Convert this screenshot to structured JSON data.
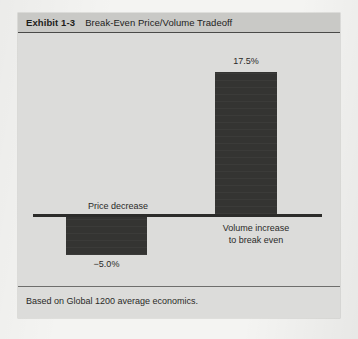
{
  "exhibit": {
    "number": "Exhibit 1-3",
    "title": "Break-Even Price/Volume Tradeoff",
    "footnote": "Based on Global 1200 average economics."
  },
  "chart_data": {
    "type": "bar",
    "title": "Break-Even Price/Volume Tradeoff",
    "subtitle": "",
    "xlabel": "",
    "ylabel": "",
    "categories": [
      "Price decrease",
      "Volume increase to break even"
    ],
    "category_labels": [
      {
        "line1": "Price decrease",
        "line2": ""
      },
      {
        "line1": "Volume increase",
        "line2": "to break even"
      }
    ],
    "values": [
      -5.0,
      17.5
    ],
    "value_labels": [
      "−5.0%",
      "17.5%"
    ],
    "ylim": [
      -7,
      20
    ],
    "grid": false,
    "legend": null,
    "bar_color": "#343432",
    "baseline": 0,
    "annotations": [
      "Based on Global 1200 average economics."
    ]
  }
}
